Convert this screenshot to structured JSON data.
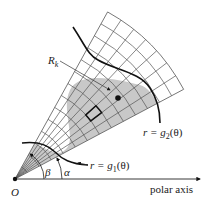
{
  "diagram": {
    "labels": {
      "region": "R",
      "region_sub": "k",
      "outer_curve": "r = g",
      "outer_curve_sub": "2",
      "outer_curve_tail": "(θ)",
      "inner_curve": "r = g",
      "inner_curve_sub": "1",
      "inner_curve_tail": "(θ)",
      "angle_alpha": "α",
      "angle_beta": "β",
      "origin": "O",
      "axis": "polar axis"
    },
    "colors": {
      "shade": "#c8c8c8",
      "grid": "#555555",
      "curve": "#111111",
      "background": "#ffffff"
    },
    "geometry": {
      "origin": [
        15,
        179
      ],
      "alpha_deg": 28,
      "beta_deg": 61,
      "outer_radius": 191,
      "radial_divisions": 7,
      "arc_divisions": 14
    }
  }
}
